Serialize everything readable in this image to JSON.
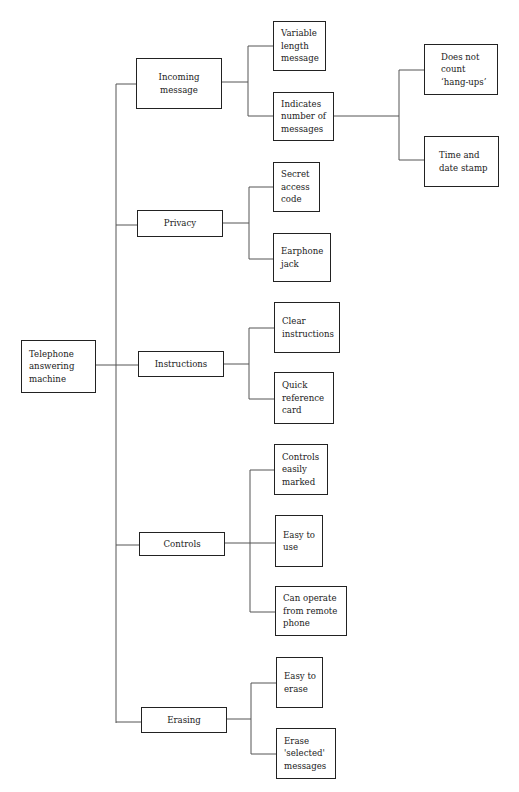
{
  "diagram": {
    "type": "tree",
    "root": {
      "id": "root",
      "label": "Telephone\nanswering\nmachine"
    },
    "branches": [
      {
        "id": "incoming",
        "label": "Incoming\nmessage",
        "children": [
          {
            "id": "variable",
            "label": "Variable\nlength\nmessage"
          },
          {
            "id": "indicates",
            "label": "Indicates\nnumber of\nmessages",
            "children": [
              {
                "id": "hangups",
                "label": "Does not\ncount\n‘hang-ups’"
              },
              {
                "id": "timedate",
                "label": "Time and\ndate stamp"
              }
            ]
          }
        ]
      },
      {
        "id": "privacy",
        "label": "Privacy",
        "children": [
          {
            "id": "secret",
            "label": "Secret\naccess\ncode"
          },
          {
            "id": "earphone",
            "label": "Earphone\njack"
          }
        ]
      },
      {
        "id": "instructions",
        "label": "Instructions",
        "children": [
          {
            "id": "clear",
            "label": "Clear\ninstructions"
          },
          {
            "id": "quickref",
            "label": "Quick\nreference\ncard"
          }
        ]
      },
      {
        "id": "controls",
        "label": "Controls",
        "children": [
          {
            "id": "marked",
            "label": "Controls\neasily\nmarked"
          },
          {
            "id": "easyuse",
            "label": "Easy to\nuse"
          },
          {
            "id": "remote",
            "label": "Can operate\nfrom remote\nphone"
          }
        ]
      },
      {
        "id": "erasing",
        "label": "Erasing",
        "children": [
          {
            "id": "easyerase",
            "label": "Easy to\nerase"
          },
          {
            "id": "selected",
            "label": "Erase\n'selected'\nmessages"
          }
        ]
      }
    ]
  },
  "colors": {
    "line": "#555555",
    "border": "#222222",
    "text": "#222222",
    "background": "#ffffff"
  }
}
